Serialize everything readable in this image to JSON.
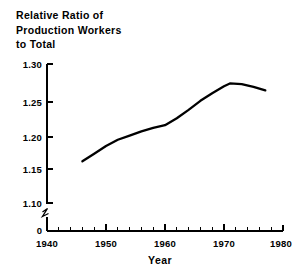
{
  "title": {
    "lines": [
      "Relative Ratio of",
      "Production Workers",
      "to Total"
    ]
  },
  "chart_data": {
    "type": "line",
    "title": "Relative Ratio of Production Workers to Total",
    "xlabel": "Year",
    "ylabel": "",
    "xlim": [
      1940,
      1980
    ],
    "ylim": [
      1.1,
      1.3
    ],
    "grid": false,
    "legend": null,
    "y_axis_break": true,
    "y_axis_break_label": "0",
    "xticks": [
      1940,
      1950,
      1960,
      1970,
      1980
    ],
    "xtick_labels": [
      "1940",
      "1950",
      "1960",
      "1970",
      "1980"
    ],
    "x_minor_tick_interval": 2,
    "yticks": [
      1.1,
      1.15,
      1.2,
      1.25,
      1.3
    ],
    "ytick_labels": [
      "1.10",
      "1.15",
      "1.20",
      "1.25",
      "1.30"
    ],
    "series": [
      {
        "name": "Relative Ratio of Production Workers to Total",
        "x": [
          1946,
          1948,
          1950,
          1952,
          1954,
          1956,
          1958,
          1960,
          1962,
          1964,
          1966,
          1968,
          1970,
          1971,
          1973,
          1975,
          1977
        ],
        "values": [
          1.16,
          1.171,
          1.182,
          1.191,
          1.197,
          1.203,
          1.208,
          1.212,
          1.222,
          1.234,
          1.247,
          1.258,
          1.268,
          1.272,
          1.271,
          1.267,
          1.262
        ]
      }
    ],
    "annotations": []
  },
  "axis": {
    "x_title": "Year",
    "zero_label": "0"
  }
}
